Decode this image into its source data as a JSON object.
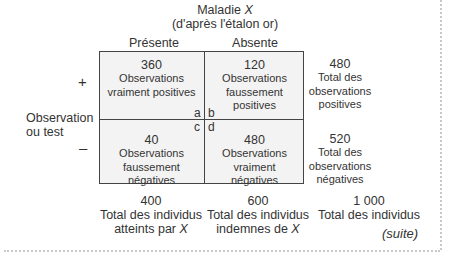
{
  "header": {
    "title_prefix": "Maladie ",
    "title_var": "X",
    "subtitle": "(d'après l'étalon or)"
  },
  "columns": [
    {
      "label": "Présente"
    },
    {
      "label": "Absente"
    }
  ],
  "rows": [
    {
      "sign": "+"
    },
    {
      "sign": "–"
    }
  ],
  "row_axis_label": [
    "Observation",
    "ou test"
  ],
  "cells": {
    "a": {
      "value": "360",
      "lines": [
        "Observations",
        "vraiment positives"
      ],
      "corner": "a"
    },
    "b": {
      "value": "120",
      "lines": [
        "Observations",
        "faussement positives"
      ],
      "corner": "b"
    },
    "c": {
      "value": "40",
      "lines": [
        "Observations",
        "faussement",
        "négatives"
      ],
      "corner": "c"
    },
    "d": {
      "value": "480",
      "lines": [
        "Observations",
        "vraiment",
        "négatives"
      ],
      "corner": "d"
    }
  },
  "row_totals": [
    {
      "value": "480",
      "lines": [
        "Total des",
        "observations",
        "positives"
      ]
    },
    {
      "value": "520",
      "lines": [
        "Total des",
        "observations",
        "négatives"
      ]
    }
  ],
  "col_totals": [
    {
      "value": "400",
      "line1": "Total des individus",
      "line2_prefix": "atteints par ",
      "line2_var": "X"
    },
    {
      "value": "600",
      "line1": "Total des individus",
      "line2_prefix": "indemnes de ",
      "line2_var": "X"
    }
  ],
  "grand_total": {
    "value": "1 000",
    "line1": "Total des individus"
  },
  "continuation": "(suite)"
}
